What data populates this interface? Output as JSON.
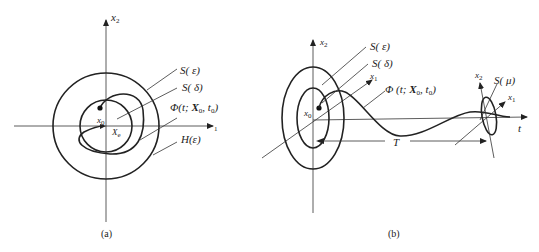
{
  "figure_a": {
    "caption": "(a)",
    "axis_x": "x",
    "axis_x_sub": "1",
    "axis_y": "x",
    "axis_y_sub": "2",
    "point_x0": "x",
    "point_x0_sub": "0",
    "point_xe": "X",
    "point_xe_sub": "e",
    "labels": {
      "s_epsilon": "S( ε)",
      "s_delta": "S( δ)",
      "phi_prefix": "Φ(t; ",
      "phi_X": "X",
      "phi_X_sub": "0",
      "phi_mid": ", t",
      "phi_t_sub": "0",
      "phi_suffix": ")",
      "h_epsilon": "H(ε)"
    }
  },
  "figure_b": {
    "caption": "(b)",
    "axis_x2": "x",
    "axis_x2_sub": "2",
    "axis_x1": "x",
    "axis_x1_sub": "1",
    "axis_t": "t",
    "point_x0": "x",
    "point_x0_sub": "0",
    "period": "T",
    "end_axis_x2": "x",
    "end_axis_x2_sub": "2",
    "end_axis_x1": "x",
    "end_axis_x1_sub": "1",
    "labels": {
      "s_epsilon": "S( ε)",
      "s_delta": "S( δ)",
      "phi_prefix": "Φ  (t; ",
      "phi_X": "X",
      "phi_X_sub": "0",
      "phi_mid": ", t",
      "phi_t_sub": "0",
      "phi_suffix": ")",
      "s_mu": "S( μ)"
    }
  }
}
